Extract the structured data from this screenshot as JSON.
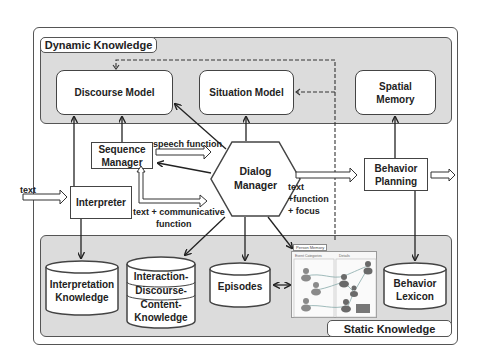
{
  "regions": {
    "dynamic_knowledge": {
      "label": "Dynamic Knowledge"
    },
    "static_knowledge": {
      "label": "Static Knowledge"
    }
  },
  "dynamic_components": [
    {
      "id": "discourse_model",
      "label": "Discourse Model"
    },
    {
      "id": "situation_model",
      "label": "Situation Model"
    },
    {
      "id": "spatial_memory",
      "label_line1": "Spatial",
      "label_line2": "Memory"
    }
  ],
  "process_components": {
    "sequence_manager": {
      "line1": "Sequence",
      "line2": "Manager"
    },
    "interpreter": {
      "label": "Interpreter"
    },
    "dialog_manager": {
      "line1": "Dialog",
      "line2": "Manager"
    },
    "behavior_planning": {
      "line1": "Behavior",
      "line2": "Planning"
    }
  },
  "static_components": {
    "interpretation_knowledge": {
      "line1": "Interpretation",
      "line2": "Knowledge"
    },
    "idc_knowledge": {
      "line1": "Interaction-",
      "line2": "Discourse-",
      "line3": "Content-",
      "line4": "Knowledge"
    },
    "episodes": {
      "label": "Episodes"
    },
    "person_memory": {
      "title": "Person Memory",
      "col1": "Event Categories",
      "col2": "Details"
    },
    "behavior_lexicon": {
      "line1": "Behavior",
      "line2": "Lexicon"
    }
  },
  "edge_labels": {
    "input_text": "text",
    "speech_function": "speech function",
    "text_communicative_line1": "text + communicative",
    "text_communicative_line2": "function",
    "dm_output_line1": "text",
    "dm_output_line2": "+function",
    "dm_output_line3": "+ focus"
  },
  "colors": {
    "region_fill": "#dcdcdc",
    "box_fill": "#ffffff",
    "stroke": "#444444"
  }
}
